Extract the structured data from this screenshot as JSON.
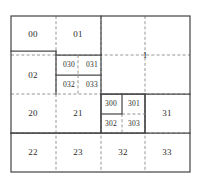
{
  "diagram": {
    "colors": {
      "solid_line": "#4a4a4a",
      "dashed_line": "#8a8a8a",
      "label_text": "#2a2a2a",
      "background": "#ffffff"
    },
    "bounds": {
      "x0": 11,
      "y0": 16,
      "x1": 190,
      "y1": 172
    },
    "grid": {
      "vertical_dashed_x": [
        56,
        101,
        145
      ],
      "horizontal_dashed_y": [
        55,
        94,
        133
      ]
    },
    "regions": [
      {
        "id": "r-00",
        "label": "00",
        "cx": 33,
        "cy": 34,
        "size": "lbl-lg"
      },
      {
        "id": "r-01",
        "label": "01",
        "cx": 78,
        "cy": 34,
        "size": "lbl-lg"
      },
      {
        "id": "r-02",
        "label": "02",
        "cx": 33,
        "cy": 75,
        "size": "lbl-lg"
      },
      {
        "id": "r-030",
        "label": "030",
        "cx": 69,
        "cy": 65,
        "size": "lbl-sm"
      },
      {
        "id": "r-031",
        "label": "031",
        "cx": 92,
        "cy": 65,
        "size": "lbl-sm"
      },
      {
        "id": "r-032",
        "label": "032",
        "cx": 69,
        "cy": 85,
        "size": "lbl-sm"
      },
      {
        "id": "r-033",
        "label": "033",
        "cx": 92,
        "cy": 85,
        "size": "lbl-sm"
      },
      {
        "id": "r-1",
        "label": "1",
        "cx": 145,
        "cy": 55,
        "size": "lbl-lg"
      },
      {
        "id": "r-20",
        "label": "20",
        "cx": 33,
        "cy": 113,
        "size": "lbl-lg"
      },
      {
        "id": "r-21",
        "label": "21",
        "cx": 78,
        "cy": 113,
        "size": "lbl-lg"
      },
      {
        "id": "r-300",
        "label": "300",
        "cx": 111,
        "cy": 104,
        "size": "lbl-sm"
      },
      {
        "id": "r-301",
        "label": "301",
        "cx": 134,
        "cy": 104,
        "size": "lbl-sm"
      },
      {
        "id": "r-302",
        "label": "302",
        "cx": 111,
        "cy": 124,
        "size": "lbl-sm"
      },
      {
        "id": "r-303",
        "label": "303",
        "cx": 134,
        "cy": 124,
        "size": "lbl-sm"
      },
      {
        "id": "r-31",
        "label": "31",
        "cx": 167,
        "cy": 113,
        "size": "lbl-lg"
      },
      {
        "id": "r-22",
        "label": "22",
        "cx": 33,
        "cy": 152,
        "size": "lbl-lg"
      },
      {
        "id": "r-23",
        "label": "23",
        "cx": 78,
        "cy": 152,
        "size": "lbl-lg"
      },
      {
        "id": "r-32",
        "label": "32",
        "cx": 123,
        "cy": 152,
        "size": "lbl-lg"
      },
      {
        "id": "r-33",
        "label": "33",
        "cx": 167,
        "cy": 152,
        "size": "lbl-lg"
      }
    ]
  }
}
